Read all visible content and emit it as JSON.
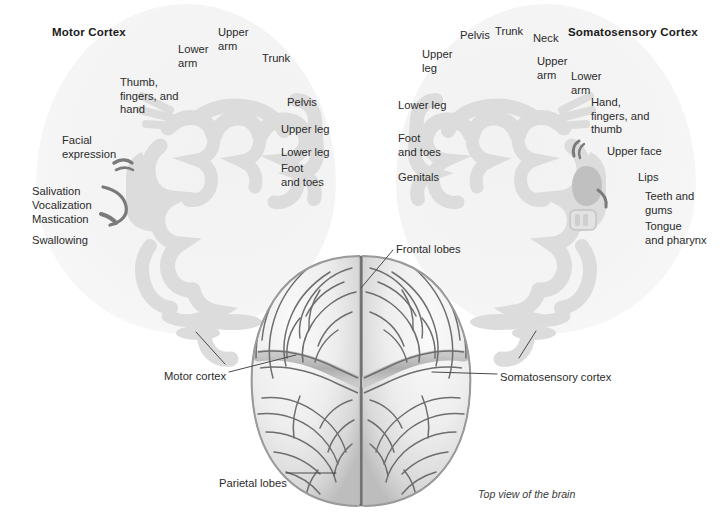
{
  "figure": {
    "width": 721,
    "height": 521,
    "background": "#ffffff",
    "caption": "Top view of the brain"
  },
  "colors": {
    "halo": "#f4f4f4",
    "cortex_strip": "#dcdcdc",
    "cortex_strip_dark": "#c0c0c0",
    "accent_dark": "#7a7a7a",
    "text": "#2b2b2b",
    "heading_text": "#1b1b1b",
    "leader_line": "#4a4a4a",
    "brain_light": "#f0f0f0",
    "brain_mid": "#d6d6d6",
    "brain_shadow": "#9a9a9a",
    "sulcus": "#6e6e6e"
  },
  "motor_cortex": {
    "title": "Motor Cortex",
    "labels": [
      {
        "text": "Upper\narm",
        "x": 218,
        "y": 26,
        "align": "left"
      },
      {
        "text": "Lower\narm",
        "x": 178,
        "y": 43,
        "align": "left"
      },
      {
        "text": "Trunk",
        "x": 262,
        "y": 52,
        "align": "left"
      },
      {
        "text": "Thumb,\nfingers, and\nhand",
        "x": 120,
        "y": 76,
        "align": "left"
      },
      {
        "text": "Pelvis",
        "x": 287,
        "y": 96,
        "align": "left"
      },
      {
        "text": "Upper leg",
        "x": 281,
        "y": 123,
        "align": "left"
      },
      {
        "text": "Facial\nexpression",
        "x": 62,
        "y": 134,
        "align": "left"
      },
      {
        "text": "Lower leg",
        "x": 281,
        "y": 146,
        "align": "left"
      },
      {
        "text": "Foot\nand toes",
        "x": 281,
        "y": 162,
        "align": "left"
      },
      {
        "text": "Salivation",
        "x": 32,
        "y": 185,
        "align": "left"
      },
      {
        "text": "Vocalization",
        "x": 32,
        "y": 199,
        "align": "left"
      },
      {
        "text": "Mastication",
        "x": 32,
        "y": 213,
        "align": "left"
      },
      {
        "text": "Swallowing",
        "x": 32,
        "y": 234,
        "align": "left"
      }
    ]
  },
  "somatosensory_cortex": {
    "title": "Somatosensory Cortex",
    "labels": [
      {
        "text": "Pelvis",
        "x": 460,
        "y": 29,
        "align": "left"
      },
      {
        "text": "Trunk",
        "x": 495,
        "y": 25,
        "align": "left"
      },
      {
        "text": "Neck",
        "x": 533,
        "y": 32,
        "align": "left"
      },
      {
        "text": "Upper\nleg",
        "x": 422,
        "y": 48,
        "align": "left"
      },
      {
        "text": "Upper\narm",
        "x": 537,
        "y": 55,
        "align": "left"
      },
      {
        "text": "Lower\narm",
        "x": 571,
        "y": 70,
        "align": "left"
      },
      {
        "text": "Lower leg",
        "x": 398,
        "y": 99,
        "align": "left"
      },
      {
        "text": "Hand,\nfingers, and\nthumb",
        "x": 591,
        "y": 96,
        "align": "left"
      },
      {
        "text": "Foot\nand toes",
        "x": 398,
        "y": 132,
        "align": "left"
      },
      {
        "text": "Upper face",
        "x": 607,
        "y": 145,
        "align": "left"
      },
      {
        "text": "Genitals",
        "x": 398,
        "y": 171,
        "align": "left"
      },
      {
        "text": "Lips",
        "x": 638,
        "y": 171,
        "align": "left"
      },
      {
        "text": "Teeth and\ngums",
        "x": 645,
        "y": 190,
        "align": "left"
      },
      {
        "text": "Tongue\nand pharynx",
        "x": 645,
        "y": 220,
        "align": "left"
      }
    ]
  },
  "brain_callouts": [
    {
      "name": "frontal-lobes",
      "text": "Frontal lobes",
      "x": 396,
      "y": 243,
      "anchor": "start"
    },
    {
      "name": "motor-cortex",
      "text": "Motor cortex",
      "x": 164,
      "y": 370,
      "anchor": "start"
    },
    {
      "name": "somatosensory-cortex",
      "text": "Somatosensory cortex",
      "x": 500,
      "y": 371,
      "anchor": "start"
    },
    {
      "name": "parietal-lobes",
      "text": "Parietal lobes",
      "x": 219,
      "y": 477,
      "anchor": "start"
    }
  ]
}
